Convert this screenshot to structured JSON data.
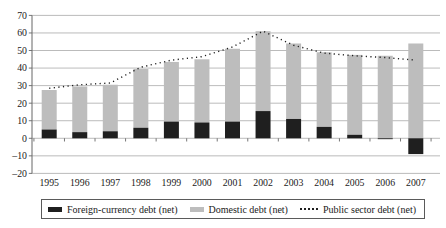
{
  "chart_data": {
    "type": "bar",
    "subtype": "stacked-bars-with-dotted-line",
    "stacked": true,
    "grid": "horizontal",
    "legend_position": "bottom",
    "title": "",
    "xlabel": "",
    "ylabel": "",
    "ylim": [
      -20,
      70
    ],
    "ytick_step": 10,
    "categories": [
      "1995",
      "1996",
      "1997",
      "1998",
      "1999",
      "2000",
      "2001",
      "2002",
      "2003",
      "2004",
      "2005",
      "2006",
      "2007"
    ],
    "series": [
      {
        "name": "Foreign-currency debt (net)",
        "render": "bar",
        "color": "#1f1f1f",
        "values": [
          5,
          3.5,
          4,
          6,
          9.5,
          9,
          9.5,
          15.5,
          11,
          6.5,
          2,
          -0.5,
          -9
        ]
      },
      {
        "name": "Domestic debt (net)",
        "render": "bar",
        "color": "#bdbdbd",
        "values": [
          22.5,
          26,
          26.5,
          33.5,
          34,
          36,
          41.5,
          45.5,
          43,
          42.5,
          45.5,
          47,
          54
        ]
      },
      {
        "name": "Public sector debt (net)",
        "render": "line",
        "line_style": "dotted",
        "color": "#1f1f1f",
        "values": [
          28.5,
          30.5,
          31.5,
          40.5,
          44.5,
          46.5,
          52,
          61,
          53,
          48.5,
          47,
          46,
          44.5
        ]
      }
    ],
    "colors": {
      "gridline": "#a9a9a9",
      "axis": "#666666",
      "text": "#1a1a1a"
    }
  }
}
